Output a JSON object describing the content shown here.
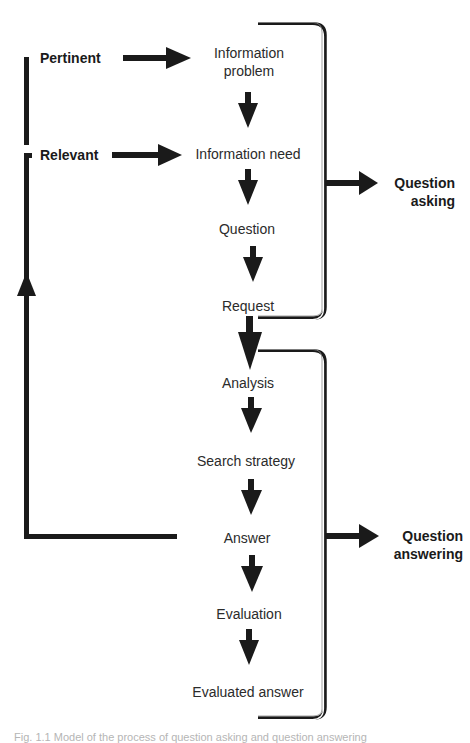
{
  "diagram": {
    "title": "Model of the process of question asking and question answering",
    "side_labels": {
      "pertinent": "Pertinent",
      "relevant": "Relevant"
    },
    "steps": [
      {
        "id": "information-problem",
        "label_line1": "Information",
        "label_line2": "problem"
      },
      {
        "id": "information-need",
        "label": "Information need"
      },
      {
        "id": "question",
        "label": "Question"
      },
      {
        "id": "request",
        "label": "Request"
      },
      {
        "id": "analysis",
        "label": "Analysis"
      },
      {
        "id": "search-strategy",
        "label": "Search strategy"
      },
      {
        "id": "answer",
        "label": "Answer"
      },
      {
        "id": "evaluation",
        "label": "Evaluation"
      },
      {
        "id": "evaluated-answer",
        "label": "Evaluated answer"
      }
    ],
    "phases": {
      "question_asking": {
        "line1": "Question",
        "line2": "asking"
      },
      "question_answering": {
        "line1": "Question",
        "line2": "answering"
      }
    },
    "colors": {
      "ink": "#1a1a1a",
      "text": "#2b2b2b",
      "background": "#ffffff"
    },
    "caption": "Fig. 1.1  Model of the process of question asking and question answering"
  }
}
